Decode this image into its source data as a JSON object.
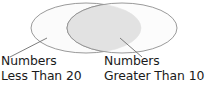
{
  "diagram": {
    "type": "venn-two-set",
    "title": "",
    "colors": {
      "stroke": "#8f8f8f",
      "set_fill": "#fbfbfb",
      "overlap_fill": "#e2e2e2",
      "leader_line": "#6e6e6e",
      "text": "#1a1a1a",
      "background": "#ffffff"
    },
    "sets": [
      {
        "id": "left-set",
        "name": "numbers-less-than-20",
        "cx": 86,
        "cy": 28,
        "rx": 55,
        "ry": 25
      },
      {
        "id": "right-set",
        "name": "numbers-greater-than-10",
        "cx": 122,
        "cy": 28,
        "rx": 55,
        "ry": 25
      }
    ],
    "leaders": [
      {
        "name": "left-leader-line",
        "x1": 10,
        "y1": 57,
        "x2": 47,
        "y2": 38
      },
      {
        "name": "right-leader-line",
        "x1": 142,
        "y1": 57,
        "x2": 120,
        "y2": 38
      }
    ]
  },
  "labels": {
    "left": {
      "line1": "Numbers",
      "line2": "Less Than 20"
    },
    "right": {
      "line1": "Numbers",
      "line2": "Greater Than 10"
    }
  }
}
